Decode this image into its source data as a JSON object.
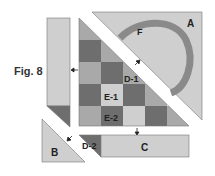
{
  "figure": {
    "caption": "Fig. 8"
  },
  "pieces": {
    "A": "A",
    "B": "B",
    "C": "C",
    "D1": "D-1",
    "D2": "D-2",
    "E1": "E-1",
    "E2": "E-2",
    "F": "F"
  },
  "colors": {
    "light": "#cfcfcf",
    "medium": "#a9a9a9",
    "dark": "#6e6e6e",
    "arc": "#8a8a8a",
    "stroke": "#555555"
  }
}
